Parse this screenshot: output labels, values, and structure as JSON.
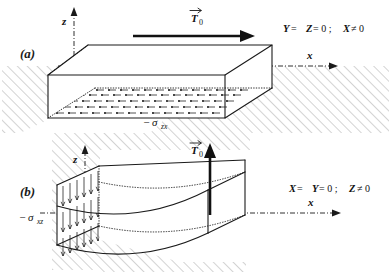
{
  "figure": {
    "background_color": "#ffffff",
    "ink_color": "#1a1a1a",
    "hatch_color": "#b9b9b9"
  },
  "panels": [
    {
      "id": "a",
      "label": "(a)",
      "traction_label": "T",
      "traction_subscript": "0",
      "traction_direction": "horizontal-right",
      "stress_sign": "−",
      "stress_symbol": "σ",
      "stress_subscript": "zx",
      "condition": "Y = Z = 0; X ≠ 0",
      "condition_parts": [
        {
          "text": "Y",
          "kind": "var"
        },
        {
          "text": " = ",
          "kind": "op"
        },
        {
          "text": "Z",
          "kind": "var"
        },
        {
          "text": " = 0 ; ",
          "kind": "op"
        },
        {
          "text": "X",
          "kind": "var"
        },
        {
          "text": " ≠ 0",
          "kind": "op"
        }
      ],
      "axis_z": "z",
      "axis_x": "x",
      "surface_markers": "dot-arrow-grid"
    },
    {
      "id": "b",
      "label": "(b)",
      "traction_label": "T",
      "traction_subscript": "0",
      "traction_direction": "vertical-up",
      "stress_sign": "−",
      "stress_symbol": "σ",
      "stress_subscript": "xz",
      "condition": "X = Y = 0; Z ≠ 0",
      "condition_parts": [
        {
          "text": "X",
          "kind": "var"
        },
        {
          "text": " = ",
          "kind": "op"
        },
        {
          "text": "Y",
          "kind": "var"
        },
        {
          "text": " = 0 ; ",
          "kind": "op"
        },
        {
          "text": "Z",
          "kind": "var"
        },
        {
          "text": " ≠ 0",
          "kind": "op"
        }
      ],
      "axis_z": "z",
      "axis_x": "x",
      "surface_markers": "down-arrow-grid"
    }
  ]
}
